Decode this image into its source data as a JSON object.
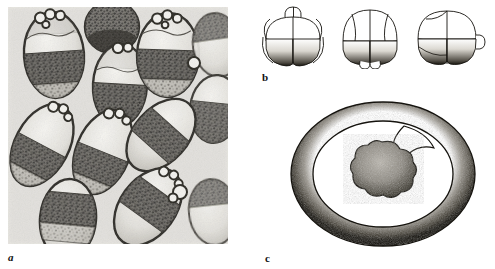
{
  "figure": {
    "background_color": "#ffffff",
    "ink_color": "#1a1a1a"
  },
  "panels": [
    {
      "id": "a",
      "label": "a",
      "kind": "light-micrograph",
      "caption_style": "italic-bold-lowercase",
      "description": "Light micrograph of numerous ovoid egg capsules, each containing a pale upper region and a dark granular embryonic mass; clusters of small refractile globules sit at one pole of several capsules.",
      "frame": {
        "x": 8,
        "y": 7,
        "width": 220,
        "height": 237
      },
      "tone": {
        "paper": "#efeeea",
        "mid": "#8d8a84",
        "dark": "#1a1a1a"
      },
      "capsules": [
        {
          "cx": 46,
          "cy": 48,
          "rx": 30,
          "ry": 43,
          "rot": -4,
          "globules": 4,
          "dark_band_top": 0.46,
          "dark_band_bottom": 0.8
        },
        {
          "cx": 104,
          "cy": 20,
          "rx": 27,
          "ry": 26,
          "rot": 0,
          "globules": 0,
          "dark_band_top": 0.1,
          "dark_band_bottom": 0.95
        },
        {
          "cx": 112,
          "cy": 78,
          "rx": 27,
          "ry": 41,
          "rot": 3,
          "globules": 2,
          "dark_band_top": 0.48,
          "dark_band_bottom": 0.9
        },
        {
          "cx": 160,
          "cy": 48,
          "rx": 31,
          "ry": 42,
          "rot": 2,
          "globules": 4,
          "dark_band_top": 0.44,
          "dark_band_bottom": 0.78
        },
        {
          "cx": 209,
          "cy": 38,
          "rx": 24,
          "ry": 32,
          "rot": -8,
          "globules": 0,
          "dark_band_top": 0.05,
          "dark_band_bottom": 0.55
        },
        {
          "cx": 207,
          "cy": 102,
          "rx": 25,
          "ry": 34,
          "rot": 6,
          "globules": 0,
          "dark_band_top": 0.4,
          "dark_band_bottom": 0.95
        },
        {
          "cx": 34,
          "cy": 138,
          "rx": 27,
          "ry": 44,
          "rot": 28,
          "globules": 3,
          "dark_band_top": 0.45,
          "dark_band_bottom": 0.86
        },
        {
          "cx": 95,
          "cy": 145,
          "rx": 27,
          "ry": 44,
          "rot": 22,
          "globules": 3,
          "dark_band_top": 0.46,
          "dark_band_bottom": 0.86
        },
        {
          "cx": 153,
          "cy": 128,
          "rx": 27,
          "ry": 42,
          "rot": 42,
          "globules": 0,
          "dark_band_top": 0.3,
          "dark_band_bottom": 0.72
        },
        {
          "cx": 60,
          "cy": 212,
          "rx": 28,
          "ry": 40,
          "rot": 5,
          "globules": 0,
          "dark_band_top": 0.18,
          "dark_band_bottom": 0.72
        },
        {
          "cx": 140,
          "cy": 200,
          "rx": 28,
          "ry": 43,
          "rot": 36,
          "globules": 3,
          "dark_band_top": 0.3,
          "dark_band_bottom": 0.74
        },
        {
          "cx": 205,
          "cy": 205,
          "rx": 24,
          "ry": 33,
          "rot": -6,
          "globules": 0,
          "dark_band_top": 0.1,
          "dark_band_bottom": 0.6
        }
      ],
      "free_globules": [
        {
          "cx": 172,
          "cy": 185,
          "r": 7
        },
        {
          "cx": 186,
          "cy": 56,
          "r": 6
        }
      ]
    },
    {
      "id": "b",
      "label": "b",
      "kind": "line-drawing",
      "description": "Three ink drawings of an eight-cell stage embryo seen from three orientations: four clear animal-pole blastomeres above and four stippled, darker vegetal blastomeres below.",
      "frame": {
        "x": 255,
        "y": 5,
        "width": 238,
        "height": 66
      },
      "embryos": [
        {
          "index": 1,
          "view": "lateral-with-polar-lobes-up",
          "animal_cells": 4,
          "vegetal_cells": 4,
          "stipple": "heavy-lower",
          "width": 72,
          "height": 62
        },
        {
          "index": 2,
          "view": "lateral-with-polar-lobes-down",
          "animal_cells": 4,
          "vegetal_cells": 4,
          "stipple": "heavy-lower",
          "width": 72,
          "height": 62
        },
        {
          "index": 3,
          "view": "oblique-right",
          "animal_cells": 4,
          "vegetal_cells": 4,
          "stipple": "heavy-lower",
          "width": 76,
          "height": 62
        }
      ]
    },
    {
      "id": "c",
      "label": "c",
      "kind": "line-drawing",
      "description": "Optical section of a later embryo: a thick stippled outer envelope (serosa) enclosing a clear perivitelline space, with a lobed, densely stippled embryonic mass at the centre and an invagination at the upper right of the inner wall.",
      "frame": {
        "x": 286,
        "y": 100,
        "width": 200,
        "height": 148
      },
      "outer_ellipse": {
        "cx": 97,
        "cy": 74,
        "rx": 92,
        "ry": 72
      },
      "inner_ellipse": {
        "cx": 97,
        "cy": 74,
        "rx": 70,
        "ry": 53
      },
      "central_mass": {
        "cx": 96,
        "cy": 78,
        "r": 36,
        "lobes": 8
      },
      "invagination": {
        "position": "upper-right",
        "angle_deg": 55
      }
    }
  ]
}
